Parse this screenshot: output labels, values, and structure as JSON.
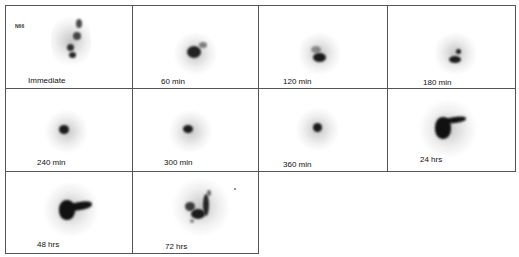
{
  "figure": {
    "panel_tag": "N66",
    "panels": [
      {
        "label": "Immediate"
      },
      {
        "label": "60 min"
      },
      {
        "label": "120 min"
      },
      {
        "label": "180 min"
      },
      {
        "label": "240 min"
      },
      {
        "label": "300 min"
      },
      {
        "label": "360 min"
      },
      {
        "label": "24 hrs"
      },
      {
        "label": "48 hrs"
      },
      {
        "label": "72 hrs"
      }
    ]
  }
}
